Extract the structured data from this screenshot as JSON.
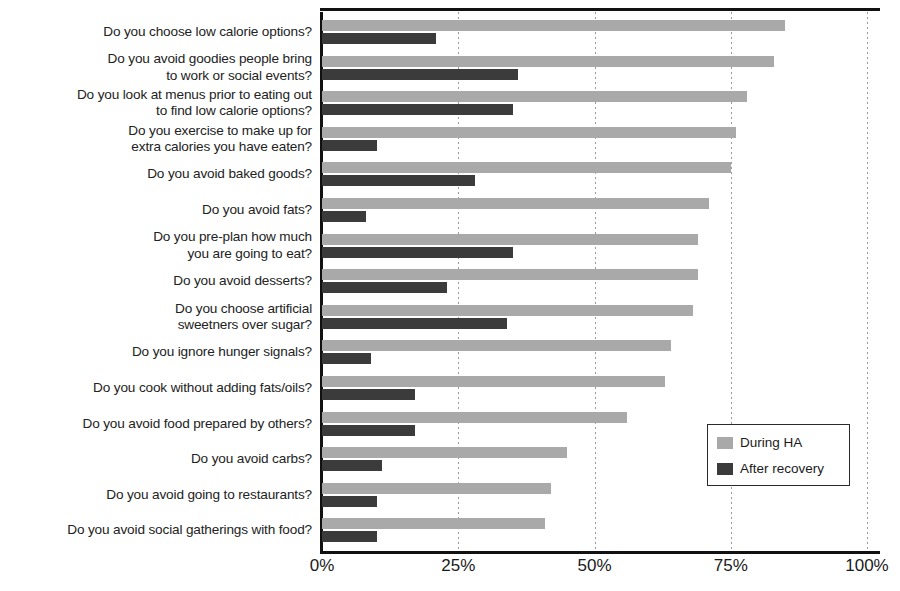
{
  "chart_data": {
    "type": "bar",
    "orientation": "horizontal",
    "title": "",
    "xlabel": "",
    "ylabel": "",
    "xlim": [
      0,
      100
    ],
    "xticks": [
      "0%",
      "25%",
      "50%",
      "75%",
      "100%"
    ],
    "xtick_values": [
      0,
      25,
      50,
      75,
      100
    ],
    "grid": "vertical-dotted",
    "legend_position": "middle-right-inside",
    "categories": [
      "Do you choose low calorie options?",
      "Do you avoid goodies people bring\nto work or social events?",
      "Do you look at menus prior to eating out\nto find low calorie options?",
      "Do you exercise to make up for\nextra calories you have eaten?",
      "Do you avoid baked goods?",
      "Do you avoid fats?",
      "Do you pre-plan how much\nyou are going to eat?",
      "Do you avoid desserts?",
      "Do you choose artificial\nsweetners over sugar?",
      "Do you ignore hunger signals?",
      "Do you cook without adding fats/oils?",
      "Do you avoid food prepared by others?",
      "Do you avoid carbs?",
      "Do you avoid going to restaurants?",
      "Do you avoid social gatherings with food?"
    ],
    "series": [
      {
        "name": "During HA",
        "color": "#a9a9a9",
        "values": [
          85,
          83,
          78,
          76,
          75,
          71,
          69,
          69,
          68,
          64,
          63,
          56,
          45,
          42,
          41
        ]
      },
      {
        "name": "After recovery",
        "color": "#3b3b3b",
        "values": [
          21,
          36,
          35,
          10,
          28,
          8,
          35,
          23,
          34,
          9,
          17,
          17,
          11,
          10,
          10
        ]
      }
    ]
  },
  "legend": {
    "items": [
      {
        "label": "During HA"
      },
      {
        "label": "After recovery"
      }
    ]
  },
  "colors": {
    "during": "#a9a9a9",
    "after": "#3b3b3b",
    "axis": "#111111",
    "grid": "#9a9a9a",
    "text": "#222222",
    "background": "#ffffff"
  }
}
